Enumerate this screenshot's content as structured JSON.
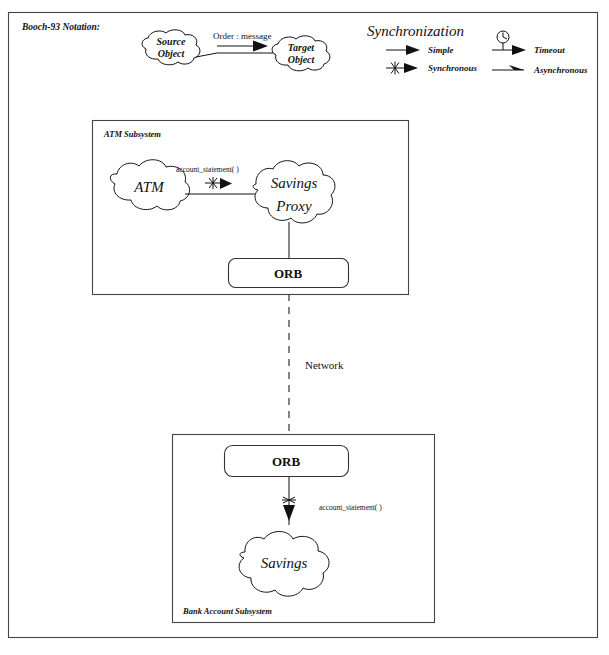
{
  "diagram": {
    "notation_label": "Booch-93 Notation:",
    "legend": {
      "title": "Synchronization",
      "items": [
        {
          "icon": "simple-arrow-icon",
          "label": "Simple"
        },
        {
          "icon": "synchronous-arrow-icon",
          "label": "Synchronous"
        },
        {
          "icon": "timeout-arrow-icon",
          "label": "Timeout"
        },
        {
          "icon": "asynchronous-arrow-icon",
          "label": "Asynchronous"
        }
      ]
    },
    "notation_example": {
      "source_line1": "Source",
      "source_line2": "Object",
      "target_line1": "Target",
      "target_line2": "Object",
      "message_label": "Order : message"
    },
    "atm_subsystem": {
      "title": "ATM Subsystem",
      "atm_cloud": "ATM",
      "proxy_line1": "Savings",
      "proxy_line2": "Proxy",
      "message_label": "account_statement( )",
      "orb_label": "ORB"
    },
    "network": {
      "label": "Network"
    },
    "bank_subsystem": {
      "title": "Bank Account Subsystem",
      "orb_label": "ORB",
      "savings_cloud": "Savings",
      "message_label": "account_statement( )"
    },
    "colors": {
      "ink": "#111111",
      "frame": "#444444",
      "paper": "#ffffff"
    }
  }
}
